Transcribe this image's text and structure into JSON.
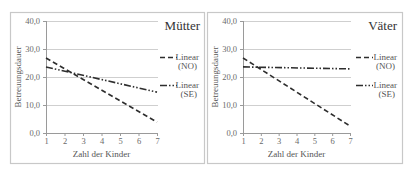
{
  "chart_data": [
    {
      "type": "line",
      "title": "Mütter",
      "xlabel": "Zahl der Kinder",
      "ylabel": "Betreuungsdauer",
      "x": [
        1,
        7
      ],
      "x_ticks": [
        "1",
        "2",
        "3",
        "4",
        "5",
        "6",
        "7"
      ],
      "y_ticks": [
        "0,0",
        "10,0",
        "20,0",
        "30,0",
        "40,0"
      ],
      "ylim": [
        0,
        40
      ],
      "grid": true,
      "legend_position": "right",
      "series": [
        {
          "name": "Linear (NO)",
          "legend_line1": "Linear",
          "legend_line2": "(NO)",
          "style": "dashed",
          "values": [
            26.8,
            3.9
          ]
        },
        {
          "name": "Linear (SE)",
          "legend_line1": "Linear",
          "legend_line2": "(SE)",
          "style": "dash-dot-dot",
          "values": [
            23.6,
            14.6
          ]
        }
      ]
    },
    {
      "type": "line",
      "title": "Väter",
      "xlabel": "Zahl der Kinder",
      "ylabel": "Betreuungsdauer",
      "x": [
        1,
        7
      ],
      "x_ticks": [
        "1",
        "2",
        "3",
        "4",
        "5",
        "6",
        "7"
      ],
      "y_ticks": [
        "0,0",
        "10,0",
        "20,0",
        "30,0",
        "40,0"
      ],
      "ylim": [
        0,
        40
      ],
      "grid": true,
      "legend_position": "right",
      "series": [
        {
          "name": "Linear (NO)",
          "legend_line1": "Linear",
          "legend_line2": "(NO)",
          "style": "dashed",
          "values": [
            26.8,
            2.5
          ]
        },
        {
          "name": "Linear (SE)",
          "legend_line1": "Linear",
          "legend_line2": "(SE)",
          "style": "dash-dot-dot",
          "values": [
            23.6,
            22.9
          ]
        }
      ]
    }
  ],
  "colors": {
    "border": "#c8c8c8",
    "grid": "#cfcfcf",
    "axis": "#9a9a9a",
    "line": "#2e2e2e"
  }
}
